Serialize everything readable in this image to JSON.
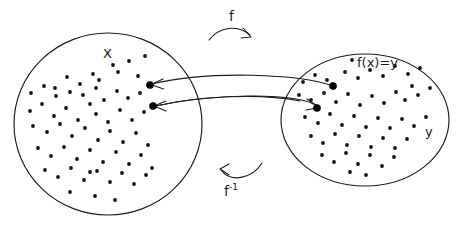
{
  "diagram": {
    "kind": "function-mapping-diagram",
    "background_color": "#ffffff",
    "ink_color": "#1c1c1c",
    "labels": {
      "set_x": "X",
      "set_y": "y",
      "image_equation": "f(x)=y",
      "forward_map": "f",
      "inverse_map_base": "f",
      "inverse_map_exponent": "-1"
    },
    "sets": [
      {
        "name": "X",
        "label": "X",
        "shape": "ellipse",
        "cx": 108,
        "cy": 124,
        "rx": 94,
        "ry": 91,
        "element_count": 66
      },
      {
        "name": "Y",
        "label": "y",
        "shape": "ellipse",
        "cx": 365,
        "cy": 120,
        "rx": 84,
        "ry": 66,
        "element_count": 55
      }
    ],
    "mappings": [
      {
        "name": "forward-upper",
        "from_point": [
          333,
          86
        ],
        "to_point": [
          150,
          85
        ],
        "direction": "right-to-left",
        "label": "f"
      },
      {
        "name": "forward-lower",
        "from_point": [
          153,
          106
        ],
        "to_point": [
          317,
          108
        ],
        "direction": "left-to-right",
        "label": "f"
      }
    ],
    "highlighted_elements": [
      {
        "set": "X",
        "cx": 150,
        "cy": 85,
        "r": 3.6
      },
      {
        "set": "X",
        "cx": 153,
        "cy": 106,
        "r": 3.6
      },
      {
        "set": "Y",
        "cx": 333,
        "cy": 86,
        "r": 3.6
      },
      {
        "set": "Y",
        "cx": 317,
        "cy": 108,
        "r": 3.6
      }
    ],
    "x_dots": [
      [
        55,
        88
      ],
      [
        67,
        77
      ],
      [
        80,
        84
      ],
      [
        93,
        74
      ],
      [
        99,
        80
      ],
      [
        113,
        65
      ],
      [
        118,
        72
      ],
      [
        129,
        61
      ],
      [
        138,
        76
      ],
      [
        145,
        56
      ],
      [
        150,
        85
      ],
      [
        31,
        93
      ],
      [
        44,
        86
      ],
      [
        56,
        96
      ],
      [
        70,
        92
      ],
      [
        83,
        95
      ],
      [
        96,
        88
      ],
      [
        104,
        100
      ],
      [
        117,
        91
      ],
      [
        128,
        98
      ],
      [
        140,
        93
      ],
      [
        153,
        106
      ],
      [
        30,
        111
      ],
      [
        42,
        104
      ],
      [
        54,
        116
      ],
      [
        66,
        108
      ],
      [
        78,
        120
      ],
      [
        90,
        104
      ],
      [
        96,
        114
      ],
      [
        108,
        122
      ],
      [
        120,
        110
      ],
      [
        132,
        120
      ],
      [
        144,
        112
      ],
      [
        33,
        126
      ],
      [
        47,
        132
      ],
      [
        60,
        124
      ],
      [
        72,
        136
      ],
      [
        85,
        128
      ],
      [
        98,
        140
      ],
      [
        110,
        131
      ],
      [
        123,
        142
      ],
      [
        136,
        133
      ],
      [
        148,
        145
      ],
      [
        38,
        148
      ],
      [
        51,
        156
      ],
      [
        64,
        147
      ],
      [
        77,
        159
      ],
      [
        90,
        150
      ],
      [
        103,
        162
      ],
      [
        116,
        152
      ],
      [
        129,
        164
      ],
      [
        141,
        155
      ],
      [
        152,
        168
      ],
      [
        45,
        170
      ],
      [
        58,
        177
      ],
      [
        71,
        168
      ],
      [
        84,
        180
      ],
      [
        90,
        172
      ],
      [
        97,
        171
      ],
      [
        110,
        182
      ],
      [
        122,
        173
      ],
      [
        134,
        184
      ],
      [
        146,
        175
      ],
      [
        70,
        192
      ],
      [
        95,
        196
      ],
      [
        115,
        200
      ]
    ],
    "y_dots": [
      [
        303,
        82
      ],
      [
        315,
        75
      ],
      [
        327,
        80
      ],
      [
        333,
        86
      ],
      [
        345,
        72
      ],
      [
        358,
        78
      ],
      [
        370,
        70
      ],
      [
        352,
        60
      ],
      [
        383,
        76
      ],
      [
        395,
        66
      ],
      [
        408,
        74
      ],
      [
        420,
        68
      ],
      [
        299,
        95
      ],
      [
        311,
        100
      ],
      [
        317,
        108
      ],
      [
        324,
        93
      ],
      [
        336,
        102
      ],
      [
        348,
        94
      ],
      [
        360,
        105
      ],
      [
        372,
        96
      ],
      [
        384,
        103
      ],
      [
        396,
        92
      ],
      [
        405,
        100
      ],
      [
        418,
        95
      ],
      [
        430,
        88
      ],
      [
        412,
        86
      ],
      [
        305,
        117
      ],
      [
        318,
        123
      ],
      [
        330,
        114
      ],
      [
        342,
        125
      ],
      [
        354,
        116
      ],
      [
        366,
        127
      ],
      [
        378,
        118
      ],
      [
        390,
        128
      ],
      [
        402,
        119
      ],
      [
        414,
        126
      ],
      [
        426,
        117
      ],
      [
        311,
        136
      ],
      [
        323,
        143
      ],
      [
        335,
        134
      ],
      [
        347,
        145
      ],
      [
        359,
        136
      ],
      [
        371,
        147
      ],
      [
        383,
        138
      ],
      [
        395,
        148
      ],
      [
        407,
        139
      ],
      [
        322,
        155
      ],
      [
        334,
        162
      ],
      [
        346,
        153
      ],
      [
        358,
        164
      ],
      [
        370,
        155
      ],
      [
        382,
        166
      ],
      [
        394,
        157
      ],
      [
        350,
        172
      ],
      [
        366,
        175
      ]
    ]
  }
}
